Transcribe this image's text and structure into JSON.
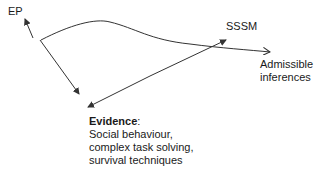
{
  "nodes": {
    "ep": {
      "label": "EP"
    },
    "sssm": {
      "label": "SSSM"
    },
    "admissible": {
      "lines": [
        "Admissible",
        "inferences"
      ]
    },
    "evidence": {
      "title": "Evidence",
      "title_suffix": ":",
      "lines": [
        "Social behaviour,",
        "complex task solving,",
        "survival techniques"
      ]
    }
  },
  "edges": [
    {
      "from": "evidence",
      "to": "ep",
      "style": "straight-arrow"
    },
    {
      "from": "ep",
      "to": "admissible",
      "style": "curved-arrow"
    },
    {
      "from": "sssm",
      "to": "evidence",
      "style": "double-headed-arrow"
    }
  ],
  "colors": {
    "line": "#333333",
    "text": "#1a1a1a",
    "background": "#ffffff"
  }
}
